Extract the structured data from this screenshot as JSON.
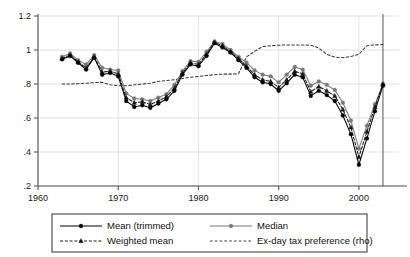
{
  "chart_data": {
    "type": "line",
    "title": "",
    "subtitle": "",
    "xlabel": "",
    "ylabel": "",
    "xlim": [
      1960,
      2005
    ],
    "ylim": [
      0.2,
      1.2
    ],
    "grid": true,
    "legend_position": "bottom",
    "x_ticks": [
      "1960",
      "1970",
      "1980",
      "1990",
      "2000"
    ],
    "x_tick_values": [
      1960,
      1970,
      1980,
      1990,
      2000
    ],
    "y_ticks": [
      ".2",
      ".4",
      ".6",
      ".8",
      "1",
      "1.2"
    ],
    "y_tick_values": [
      0.2,
      0.4,
      0.6,
      0.8,
      1.0,
      1.2
    ],
    "annotations": [
      {
        "name": "vertical-reference-line",
        "type": "vline",
        "x": 2003
      }
    ],
    "series": [
      {
        "name": "Mean (trimmed)",
        "marker": "circle-filled",
        "line": "solid",
        "color": "#000000",
        "x": [
          1963,
          1964,
          1965,
          1966,
          1967,
          1968,
          1969,
          1970,
          1971,
          1972,
          1973,
          1974,
          1975,
          1976,
          1977,
          1978,
          1979,
          1980,
          1981,
          1982,
          1983,
          1984,
          1985,
          1986,
          1987,
          1988,
          1989,
          1990,
          1991,
          1992,
          1993,
          1994,
          1995,
          1996,
          1997,
          1998,
          1999,
          2000,
          2001,
          2002,
          2003
        ],
        "values": [
          0.945,
          0.965,
          0.925,
          0.885,
          0.955,
          0.855,
          0.865,
          0.845,
          0.7,
          0.665,
          0.675,
          0.66,
          0.685,
          0.71,
          0.76,
          0.855,
          0.915,
          0.905,
          0.965,
          1.04,
          1.015,
          0.985,
          0.94,
          0.895,
          0.84,
          0.81,
          0.8,
          0.76,
          0.805,
          0.855,
          0.84,
          0.73,
          0.76,
          0.735,
          0.7,
          0.615,
          0.505,
          0.325,
          0.48,
          0.64,
          0.79
        ]
      },
      {
        "name": "Median",
        "marker": "circle-filled",
        "line": "solid",
        "color": "#7a7a7a",
        "x": [
          1963,
          1964,
          1965,
          1966,
          1967,
          1968,
          1969,
          1970,
          1971,
          1972,
          1973,
          1974,
          1975,
          1976,
          1977,
          1978,
          1979,
          1980,
          1981,
          1982,
          1983,
          1984,
          1985,
          1986,
          1987,
          1988,
          1989,
          1990,
          1991,
          1992,
          1993,
          1994,
          1995,
          1996,
          1997,
          1998,
          1999,
          2000,
          2001,
          2002,
          2003
        ],
        "values": [
          0.96,
          0.98,
          0.94,
          0.915,
          0.97,
          0.895,
          0.885,
          0.88,
          0.745,
          0.715,
          0.71,
          0.7,
          0.72,
          0.74,
          0.795,
          0.875,
          0.935,
          0.93,
          0.99,
          1.05,
          1.035,
          1.0,
          0.96,
          0.925,
          0.88,
          0.855,
          0.845,
          0.81,
          0.855,
          0.9,
          0.885,
          0.79,
          0.815,
          0.795,
          0.765,
          0.69,
          0.585,
          0.42,
          0.555,
          0.68,
          0.8
        ]
      },
      {
        "name": "Weighted mean",
        "marker": "triangle-filled",
        "line": "dashed",
        "color": "#1a1a1a",
        "x": [
          1963,
          1964,
          1965,
          1966,
          1967,
          1968,
          1969,
          1970,
          1971,
          1972,
          1973,
          1974,
          1975,
          1976,
          1977,
          1978,
          1979,
          1980,
          1981,
          1982,
          1983,
          1984,
          1985,
          1986,
          1987,
          1988,
          1989,
          1990,
          1991,
          1992,
          1993,
          1994,
          1995,
          1996,
          1997,
          1998,
          1999,
          2000,
          2001,
          2002,
          2003
        ],
        "values": [
          0.95,
          0.97,
          0.93,
          0.895,
          0.96,
          0.87,
          0.875,
          0.86,
          0.72,
          0.69,
          0.695,
          0.68,
          0.7,
          0.725,
          0.775,
          0.865,
          0.925,
          0.915,
          0.975,
          1.045,
          1.025,
          0.99,
          0.95,
          0.905,
          0.855,
          0.825,
          0.815,
          0.78,
          0.825,
          0.875,
          0.86,
          0.755,
          0.785,
          0.76,
          0.73,
          0.65,
          0.545,
          0.37,
          0.52,
          0.665,
          0.8
        ]
      },
      {
        "name": "Ex-day tax preference (rho)",
        "marker": "none",
        "line": "dashed",
        "color": "#3a3a3a",
        "x": [
          1963,
          1964,
          1965,
          1966,
          1967,
          1968,
          1969,
          1970,
          1971,
          1972,
          1973,
          1974,
          1975,
          1976,
          1977,
          1978,
          1979,
          1980,
          1981,
          1982,
          1983,
          1984,
          1985,
          1986,
          1987,
          1988,
          1989,
          1990,
          1991,
          1992,
          1993,
          1994,
          1995,
          1996,
          1997,
          1998,
          1999,
          2000,
          2001,
          2002,
          2003
        ],
        "values": [
          0.8,
          0.8,
          0.802,
          0.805,
          0.808,
          0.81,
          0.795,
          0.79,
          0.79,
          0.795,
          0.8,
          0.805,
          0.815,
          0.82,
          0.825,
          0.832,
          0.84,
          0.845,
          0.85,
          0.855,
          0.858,
          0.858,
          0.86,
          0.96,
          0.992,
          1.02,
          1.025,
          1.028,
          1.03,
          1.03,
          1.03,
          1.028,
          1.012,
          0.975,
          0.958,
          0.955,
          0.962,
          0.975,
          1.025,
          1.03,
          1.032
        ]
      }
    ]
  },
  "legend": {
    "entries": [
      {
        "label": "Mean (trimmed)",
        "marker": "circle-filled",
        "line": "solid",
        "color": "#000000"
      },
      {
        "label": "Median",
        "marker": "circle-filled",
        "line": "solid",
        "color": "#7a7a7a"
      },
      {
        "label": "Weighted mean",
        "marker": "triangle-filled",
        "line": "dashed",
        "color": "#1a1a1a"
      },
      {
        "label": "Ex-day tax preference (rho)",
        "marker": "none",
        "line": "dashed",
        "color": "#3a3a3a"
      }
    ]
  }
}
